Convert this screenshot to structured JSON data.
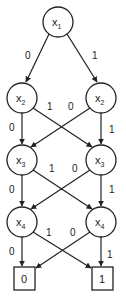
{
  "diagram": {
    "type": "binary-decision-diagram",
    "nodes": [
      {
        "id": "n1",
        "var": "x",
        "sub": "1",
        "cx": 58,
        "cy": 22
      },
      {
        "id": "n2l",
        "var": "x",
        "sub": "2",
        "cx": 22,
        "cy": 98
      },
      {
        "id": "n2r",
        "var": "x",
        "sub": "2",
        "cx": 101,
        "cy": 98
      },
      {
        "id": "n3l",
        "var": "x",
        "sub": "3",
        "cx": 22,
        "cy": 160
      },
      {
        "id": "n3r",
        "var": "x",
        "sub": "3",
        "cx": 101,
        "cy": 160
      },
      {
        "id": "n4l",
        "var": "x",
        "sub": "4",
        "cx": 22,
        "cy": 222
      },
      {
        "id": "n4r",
        "var": "x",
        "sub": "4",
        "cx": 101,
        "cy": 222
      }
    ],
    "terminals": [
      {
        "id": "t0",
        "label": "0",
        "x": 14,
        "y": 267,
        "w": 21,
        "h": 23
      },
      {
        "id": "t1",
        "label": "1",
        "x": 92,
        "y": 267,
        "w": 21,
        "h": 23
      }
    ],
    "edges": [
      {
        "from": "n1",
        "to": "n2l",
        "label": "0"
      },
      {
        "from": "n1",
        "to": "n2r",
        "label": "1"
      },
      {
        "from": "n2l",
        "to": "n3l",
        "label": "0"
      },
      {
        "from": "n2l",
        "to": "n3r",
        "label": "1"
      },
      {
        "from": "n2r",
        "to": "n3l",
        "label": "0"
      },
      {
        "from": "n2r",
        "to": "n3r",
        "label": "1"
      },
      {
        "from": "n3l",
        "to": "n4l",
        "label": "0"
      },
      {
        "from": "n3l",
        "to": "n4r",
        "label": "1"
      },
      {
        "from": "n3r",
        "to": "n4l",
        "label": "0"
      },
      {
        "from": "n3r",
        "to": "n4r",
        "label": "1"
      },
      {
        "from": "n4l",
        "to": "t0",
        "label": "0"
      },
      {
        "from": "n4l",
        "to": "t1",
        "label": "1"
      },
      {
        "from": "n4r",
        "to": "t0",
        "label": "0"
      },
      {
        "from": "n4r",
        "to": "t1",
        "label": "1"
      }
    ],
    "labels": {
      "n1": {
        "var": "x",
        "sub": "1"
      },
      "n2l": {
        "var": "x",
        "sub": "2"
      },
      "n2r": {
        "var": "x",
        "sub": "2"
      },
      "n3l": {
        "var": "x",
        "sub": "3"
      },
      "n3r": {
        "var": "x",
        "sub": "3"
      },
      "n4l": {
        "var": "x",
        "sub": "4"
      },
      "n4r": {
        "var": "x",
        "sub": "4"
      },
      "t0": "0",
      "t1": "1",
      "e_n1_0": "0",
      "e_n1_1": "1",
      "e_n2l_0": "0",
      "e_n2l_1": "1",
      "e_n2r_0": "0",
      "e_n2r_1": "1",
      "e_n3l_0": "0",
      "e_n3l_1": "1",
      "e_n3r_0": "0",
      "e_n3r_1": "1",
      "e_n4l_0": "0",
      "e_n4l_1": "1",
      "e_n4r_0": "0",
      "e_n4r_1": "1"
    }
  }
}
